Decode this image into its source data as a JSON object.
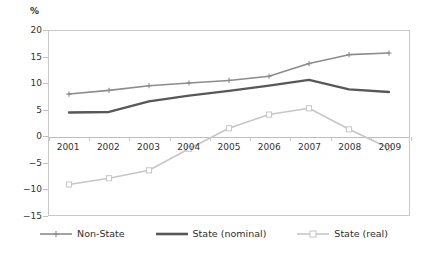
{
  "chart_data": {
    "type": "line",
    "title": "",
    "xlabel": "",
    "ylabel": "%",
    "y_unit_label": "%",
    "categories": [
      "2001",
      "2002",
      "2003",
      "2004",
      "2005",
      "2006",
      "2007",
      "2008",
      "2009"
    ],
    "x": [
      2001,
      2002,
      2003,
      2004,
      2005,
      2006,
      2007,
      2008,
      2009
    ],
    "ylim": [
      -15,
      20
    ],
    "yticks": [
      20,
      15,
      10,
      5,
      0,
      -5,
      -10,
      -15
    ],
    "ytick_labels": [
      "20",
      "15",
      "10",
      "5",
      "0",
      "−5",
      "−10",
      "−15"
    ],
    "grid": false,
    "zero_line": true,
    "legend_position": "bottom",
    "series": [
      {
        "name": "Non-State",
        "color": "#8c8c8c",
        "marker": "plus",
        "line_width": 1.6,
        "values": [
          8.0,
          8.7,
          9.6,
          10.1,
          10.6,
          11.4,
          13.8,
          15.5,
          15.8
        ]
      },
      {
        "name": "State (nominal)",
        "color": "#58585a",
        "marker": "none",
        "line_width": 2.4,
        "values": [
          4.5,
          4.6,
          6.6,
          7.7,
          8.6,
          9.6,
          10.7,
          8.9,
          8.4
        ]
      },
      {
        "name": "State (real)",
        "color": "#c6c6c6",
        "marker": "open-square",
        "line_width": 1.6,
        "values": [
          -9.2,
          -8.0,
          -6.5,
          -2.4,
          1.5,
          4.1,
          5.3,
          1.3,
          -2.3
        ]
      }
    ]
  },
  "legend": {
    "items": [
      {
        "label": "Non-State",
        "color": "#8c8c8c",
        "marker": "plus"
      },
      {
        "label": "State (nominal)",
        "color": "#58585a",
        "marker": "none"
      },
      {
        "label": "State (real)",
        "color": "#c6c6c6",
        "marker": "open-square"
      }
    ]
  },
  "colors": {
    "plot_border": "#c8c8c8",
    "zero_line": "#bdbdbd",
    "background": "#ffffff",
    "text": "#333333"
  }
}
